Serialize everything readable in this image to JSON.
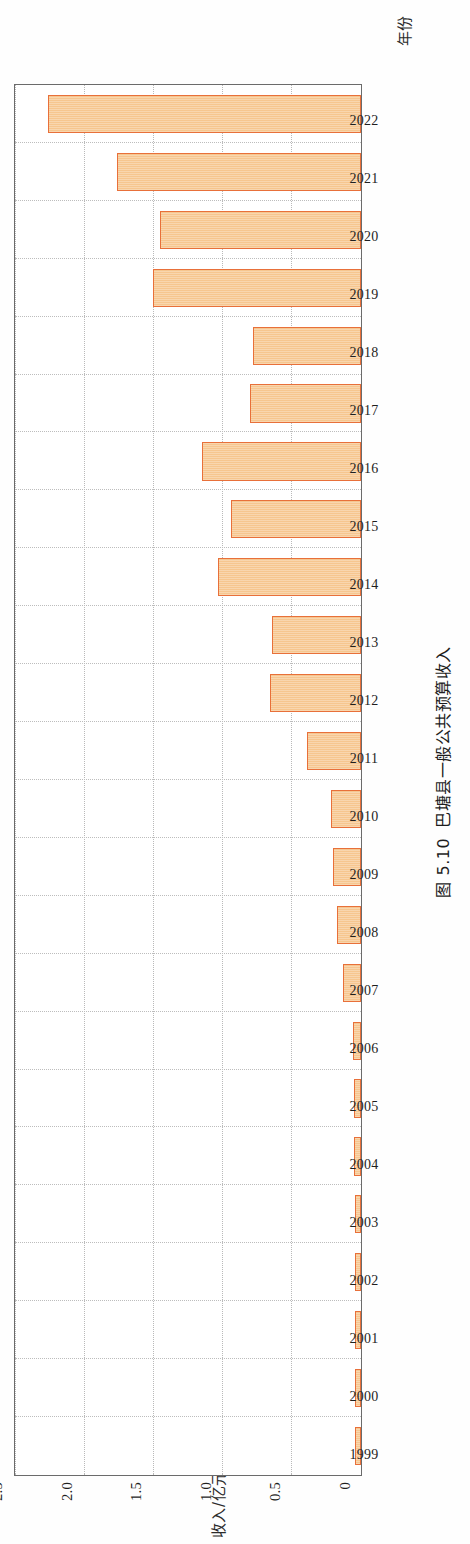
{
  "caption": {
    "number": "图 5.10",
    "text": "巴塘县一般公共预算收入"
  },
  "axis": {
    "x_title": "年份",
    "y_title": "收入/亿元"
  },
  "colors": {
    "bar_fill": "#f6c68f",
    "bar_border": "#e8703a",
    "axis": "#6b6b6b",
    "grid": "#bdbdbd"
  },
  "chart_data": {
    "type": "bar",
    "title": "巴塘县一般公共预算收入",
    "xlabel": "年份",
    "ylabel": "收入/亿元",
    "ylim": [
      0,
      2.5
    ],
    "yticks": [
      "0",
      "0.5",
      "1.0",
      "1.5",
      "2.0",
      "2.5"
    ],
    "ytick_values": [
      0,
      0.5,
      1.0,
      1.5,
      2.0,
      2.5
    ],
    "grid": true,
    "legend": "none",
    "orientation": "horizontal-bars-rotated-page",
    "categories": [
      "1999",
      "2000",
      "2001",
      "2002",
      "2003",
      "2004",
      "2005",
      "2006",
      "2007",
      "2008",
      "2009",
      "2010",
      "2011",
      "2012",
      "2013",
      "2014",
      "2015",
      "2016",
      "2017",
      "2018",
      "2019",
      "2020",
      "2021",
      "2022"
    ],
    "values": [
      0.04,
      0.04,
      0.04,
      0.04,
      0.04,
      0.05,
      0.05,
      0.06,
      0.13,
      0.17,
      0.2,
      0.22,
      0.39,
      0.66,
      0.64,
      1.03,
      0.94,
      1.15,
      0.8,
      0.78,
      1.5,
      1.45,
      1.76,
      2.26
    ]
  }
}
